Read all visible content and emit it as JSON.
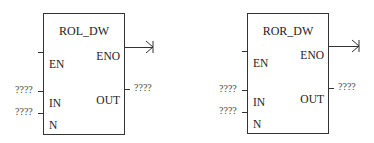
{
  "blocks": [
    {
      "name": "ROL_DW",
      "inputs": {
        "en": "EN",
        "in": "IN",
        "n": "N"
      },
      "outputs": {
        "eno": "ENO",
        "out": "OUT"
      },
      "values": {
        "in": "????",
        "n": "????",
        "out": "????"
      }
    },
    {
      "name": "ROR_DW",
      "inputs": {
        "en": "EN",
        "in": "IN",
        "n": "N"
      },
      "outputs": {
        "eno": "ENO",
        "out": "OUT"
      },
      "values": {
        "in": "????",
        "n": "????",
        "out": "????"
      }
    }
  ]
}
